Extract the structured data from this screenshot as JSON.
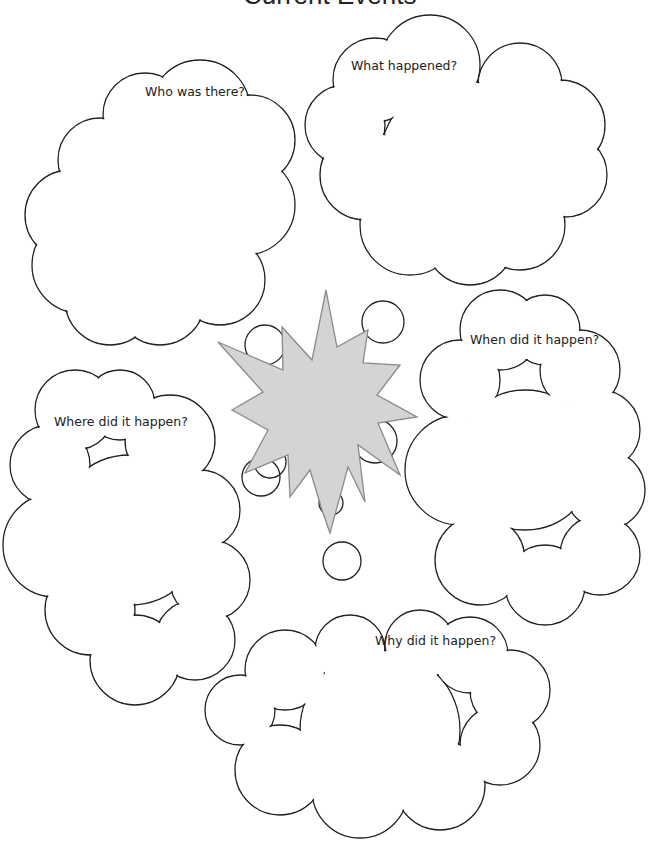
{
  "page": {
    "title": "Current Events"
  },
  "clouds": {
    "who": "Who was there?",
    "what": "What happened?",
    "when": "When did it happen?",
    "where": "Where did it happen?",
    "why": "Why did it happen?"
  },
  "colors": {
    "starburst_fill": "#d4d4d4",
    "starburst_stroke": "#8a8a8a",
    "outline": "#222222"
  }
}
